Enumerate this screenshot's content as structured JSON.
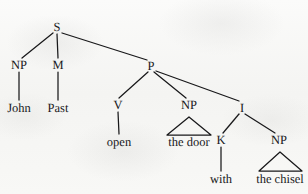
{
  "figure": {
    "kind": "syntactic-tree-diagram",
    "sentence": "John Past open the door with the chisel",
    "ink_color": "#18181a",
    "paper_color": "#f7f7f5"
  },
  "nodes": {
    "s": {
      "label": "S",
      "x": 57,
      "y": 27
    },
    "np_subject": {
      "label": "NP",
      "x": 19,
      "y": 65
    },
    "m": {
      "label": "M",
      "x": 58,
      "y": 65
    },
    "p": {
      "label": "P",
      "x": 151,
      "y": 66
    },
    "v": {
      "label": "V",
      "x": 118,
      "y": 105
    },
    "np_object": {
      "label": "NP",
      "x": 189,
      "y": 105
    },
    "i": {
      "label": "I",
      "x": 242,
      "y": 108
    },
    "k": {
      "label": "K",
      "x": 221,
      "y": 140
    },
    "np_oblique": {
      "label": "NP",
      "x": 279,
      "y": 140
    }
  },
  "leaves": {
    "john": {
      "label": "John",
      "x": 19,
      "y": 108
    },
    "past": {
      "label": "Past",
      "x": 58,
      "y": 108
    },
    "open": {
      "label": "open",
      "x": 119,
      "y": 142
    },
    "the_door": {
      "label": "the door",
      "x": 189,
      "y": 142
    },
    "with": {
      "label": "with",
      "x": 221,
      "y": 179
    },
    "the_chisel": {
      "label": "the chisel",
      "x": 280,
      "y": 179
    }
  },
  "edges": [
    {
      "name": "s-to-np-subject",
      "x1": 53,
      "y1": 33,
      "x2": 22,
      "y2": 58
    },
    {
      "name": "s-to-m",
      "x1": 57,
      "y1": 34,
      "x2": 58,
      "y2": 58
    },
    {
      "name": "s-to-p",
      "x1": 62,
      "y1": 33,
      "x2": 147,
      "y2": 60
    },
    {
      "name": "p-to-v",
      "x1": 148,
      "y1": 72,
      "x2": 119,
      "y2": 98
    },
    {
      "name": "p-to-np-object",
      "x1": 154,
      "y1": 72,
      "x2": 186,
      "y2": 98
    },
    {
      "name": "p-to-i",
      "x1": 156,
      "y1": 71,
      "x2": 239,
      "y2": 101
    },
    {
      "name": "np-subject-to-john",
      "x1": 19,
      "y1": 72,
      "x2": 19,
      "y2": 100
    },
    {
      "name": "m-to-past",
      "x1": 58,
      "y1": 72,
      "x2": 58,
      "y2": 100
    },
    {
      "name": "v-to-open",
      "x1": 118,
      "y1": 112,
      "x2": 119,
      "y2": 134
    },
    {
      "name": "i-to-k",
      "x1": 239,
      "y1": 114,
      "x2": 223,
      "y2": 133
    },
    {
      "name": "i-to-np-oblique",
      "x1": 245,
      "y1": 114,
      "x2": 275,
      "y2": 133
    },
    {
      "name": "k-to-with",
      "x1": 221,
      "y1": 147,
      "x2": 221,
      "y2": 171
    }
  ],
  "triangles": [
    {
      "name": "np-object-triangle",
      "apex_x": 189,
      "apex_y": 117,
      "left_x": 167,
      "right_x": 211,
      "base_y": 135
    },
    {
      "name": "np-oblique-triangle",
      "apex_x": 280,
      "apex_y": 152,
      "left_x": 259,
      "right_x": 302,
      "base_y": 171
    }
  ]
}
